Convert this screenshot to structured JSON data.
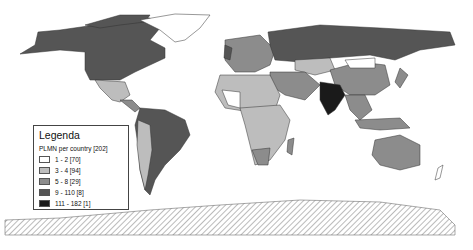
{
  "legend": {
    "title": "Legenda",
    "subtitle": "PLMN per country [202]",
    "items": [
      {
        "label": "1 - 2  [70]",
        "color": "#ffffff"
      },
      {
        "label": "3 - 4  [94]",
        "color": "#bdbdbd"
      },
      {
        "label": "5 - 8  [29]",
        "color": "#8c8c8c"
      },
      {
        "label": "9 - 110  [8]",
        "color": "#555555"
      },
      {
        "label": "111 - 182  [1]",
        "color": "#1a1a1a"
      }
    ]
  },
  "colors": {
    "no_data_hatch": "#888888",
    "border": "#333333"
  }
}
